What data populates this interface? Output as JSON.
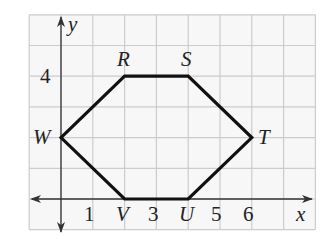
{
  "figure": {
    "type": "coordinate-plane-polygon",
    "grid": {
      "x_min": -1,
      "x_max": 8,
      "y_min": -1,
      "y_max": 6,
      "color": "#c9c9c9",
      "background": "#f7f7f7"
    },
    "axes": {
      "x_label": "x",
      "y_label": "y",
      "color": "#333333"
    },
    "tick_labels": {
      "x": [
        {
          "value": 1,
          "text": "1"
        },
        {
          "value": 3,
          "text": "3"
        },
        {
          "value": 5,
          "text": "5"
        },
        {
          "value": 6,
          "text": "6"
        }
      ],
      "y": [
        {
          "value": 4,
          "text": "4"
        }
      ]
    },
    "polygon": {
      "name": "hexagon RSTUVW",
      "stroke": "#111111",
      "vertices": [
        {
          "label": "W",
          "x": 0,
          "y": 2
        },
        {
          "label": "R",
          "x": 2,
          "y": 4
        },
        {
          "label": "S",
          "x": 4,
          "y": 4
        },
        {
          "label": "T",
          "x": 6,
          "y": 2
        },
        {
          "label": "U",
          "x": 4,
          "y": 0
        },
        {
          "label": "V",
          "x": 2,
          "y": 0
        }
      ]
    }
  }
}
